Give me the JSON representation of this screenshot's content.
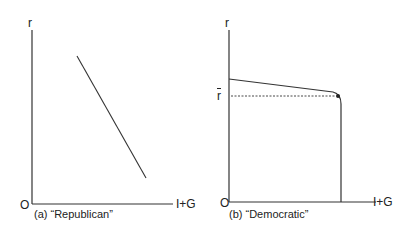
{
  "panels": [
    {
      "id": "a",
      "caption": "(a) “Republican”",
      "y_label": "r",
      "x_label": "I+G",
      "origin_label": "O",
      "curve": "straight downward-sloping line"
    },
    {
      "id": "b",
      "caption": "(b) “Democratic”",
      "y_label": "r",
      "x_label": "I+G",
      "origin_label": "O",
      "r_bar_label": "r",
      "curve": "shallow downward-sloping line that bends into a vertical line, with dashed guide at r-bar"
    }
  ]
}
